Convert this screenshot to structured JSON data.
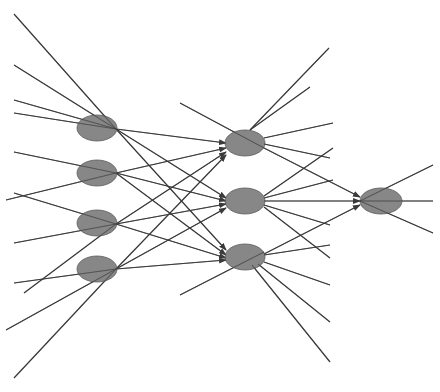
{
  "diagram": {
    "type": "neural-network",
    "layers": [
      {
        "name": "input",
        "node_count": 4
      },
      {
        "name": "hidden",
        "node_count": 3
      },
      {
        "name": "output",
        "node_count": 1
      }
    ],
    "colors": {
      "node_fill": "#7a7a7a",
      "node_stroke": "#5a5a5a",
      "line": "#3a3a3a",
      "background": "#ffffff"
    },
    "nodes": [
      {
        "id": "in1",
        "layer": "input",
        "cx": 97,
        "cy": 128,
        "rx": 20,
        "ry": 13
      },
      {
        "id": "in2",
        "layer": "input",
        "cx": 97,
        "cy": 173,
        "rx": 20,
        "ry": 13
      },
      {
        "id": "in3",
        "layer": "input",
        "cx": 97,
        "cy": 223,
        "rx": 20,
        "ry": 13
      },
      {
        "id": "in4",
        "layer": "input",
        "cx": 97,
        "cy": 269,
        "rx": 20,
        "ry": 13
      },
      {
        "id": "h1",
        "layer": "hidden",
        "cx": 245,
        "cy": 143,
        "rx": 20,
        "ry": 13
      },
      {
        "id": "h2",
        "layer": "hidden",
        "cx": 245,
        "cy": 201,
        "rx": 20,
        "ry": 13
      },
      {
        "id": "h3",
        "layer": "hidden",
        "cx": 245,
        "cy": 257,
        "rx": 20,
        "ry": 13
      },
      {
        "id": "out",
        "layer": "output",
        "cx": 381,
        "cy": 201,
        "rx": 21,
        "ry": 13
      }
    ],
    "lines": [
      {
        "x1": 14,
        "y1": 14,
        "x2": 116,
        "y2": 129
      },
      {
        "x1": 14,
        "y1": 65,
        "x2": 116,
        "y2": 129
      },
      {
        "x1": 14,
        "y1": 100,
        "x2": 116,
        "y2": 129
      },
      {
        "x1": 14,
        "y1": 113,
        "x2": 116,
        "y2": 129
      },
      {
        "x1": 14,
        "y1": 152,
        "x2": 116,
        "y2": 173
      },
      {
        "x1": 6,
        "y1": 200,
        "x2": 116,
        "y2": 173
      },
      {
        "x1": 14,
        "y1": 193,
        "x2": 116,
        "y2": 224
      },
      {
        "x1": 14,
        "y1": 243,
        "x2": 116,
        "y2": 224
      },
      {
        "x1": 14,
        "y1": 283,
        "x2": 116,
        "y2": 269
      },
      {
        "x1": 24,
        "y1": 293,
        "x2": 116,
        "y2": 224
      },
      {
        "x1": 6,
        "y1": 330,
        "x2": 116,
        "y2": 269
      },
      {
        "x1": 14,
        "y1": 378,
        "x2": 116,
        "y2": 269
      },
      {
        "x1": 116,
        "y1": 129,
        "x2": 226,
        "y2": 143,
        "arrow": true
      },
      {
        "x1": 116,
        "y1": 129,
        "x2": 226,
        "y2": 198,
        "arrow": true
      },
      {
        "x1": 116,
        "y1": 129,
        "x2": 226,
        "y2": 250,
        "arrow": true
      },
      {
        "x1": 116,
        "y1": 173,
        "x2": 226,
        "y2": 148,
        "arrow": true
      },
      {
        "x1": 116,
        "y1": 173,
        "x2": 226,
        "y2": 201,
        "arrow": true
      },
      {
        "x1": 116,
        "y1": 173,
        "x2": 226,
        "y2": 255,
        "arrow": true
      },
      {
        "x1": 116,
        "y1": 224,
        "x2": 226,
        "y2": 152,
        "arrow": true
      },
      {
        "x1": 116,
        "y1": 224,
        "x2": 226,
        "y2": 204,
        "arrow": true
      },
      {
        "x1": 116,
        "y1": 224,
        "x2": 226,
        "y2": 258,
        "arrow": true
      },
      {
        "x1": 116,
        "y1": 269,
        "x2": 226,
        "y2": 155,
        "arrow": true
      },
      {
        "x1": 116,
        "y1": 269,
        "x2": 226,
        "y2": 208,
        "arrow": true
      },
      {
        "x1": 116,
        "y1": 269,
        "x2": 226,
        "y2": 260,
        "arrow": true
      },
      {
        "x1": 180,
        "y1": 103,
        "x2": 264,
        "y2": 148
      },
      {
        "x1": 329,
        "y1": 48,
        "x2": 250,
        "y2": 130
      },
      {
        "x1": 310,
        "y1": 87,
        "x2": 250,
        "y2": 130
      },
      {
        "x1": 333,
        "y1": 123,
        "x2": 264,
        "y2": 138
      },
      {
        "x1": 330,
        "y1": 158,
        "x2": 264,
        "y2": 144
      },
      {
        "x1": 333,
        "y1": 148,
        "x2": 264,
        "y2": 196
      },
      {
        "x1": 333,
        "y1": 180,
        "x2": 264,
        "y2": 198
      },
      {
        "x1": 330,
        "y1": 225,
        "x2": 264,
        "y2": 205
      },
      {
        "x1": 330,
        "y1": 258,
        "x2": 264,
        "y2": 207
      },
      {
        "x1": 330,
        "y1": 245,
        "x2": 264,
        "y2": 255
      },
      {
        "x1": 330,
        "y1": 285,
        "x2": 264,
        "y2": 262
      },
      {
        "x1": 330,
        "y1": 322,
        "x2": 258,
        "y2": 264
      },
      {
        "x1": 330,
        "y1": 362,
        "x2": 252,
        "y2": 265
      },
      {
        "x1": 180,
        "y1": 295,
        "x2": 264,
        "y2": 252
      },
      {
        "x1": 264,
        "y1": 148,
        "x2": 360,
        "y2": 197,
        "arrow": true
      },
      {
        "x1": 264,
        "y1": 201,
        "x2": 360,
        "y2": 201,
        "arrow": true
      },
      {
        "x1": 264,
        "y1": 254,
        "x2": 360,
        "y2": 205,
        "arrow": true
      },
      {
        "x1": 360,
        "y1": 201,
        "x2": 433,
        "y2": 165
      },
      {
        "x1": 360,
        "y1": 201,
        "x2": 433,
        "y2": 201
      },
      {
        "x1": 360,
        "y1": 201,
        "x2": 433,
        "y2": 233
      }
    ]
  },
  "caption": {
    "text": ""
  }
}
